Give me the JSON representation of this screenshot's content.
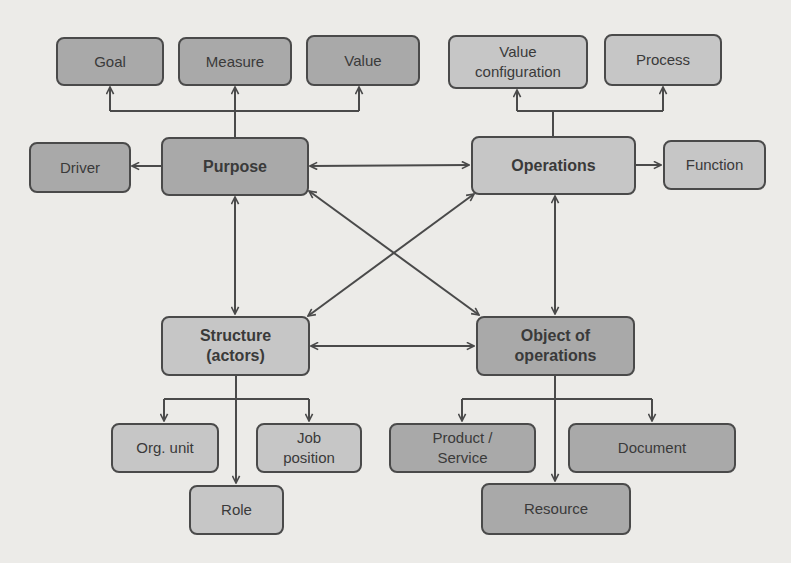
{
  "diagram": {
    "title": "",
    "colors": {
      "background": "#ecebe8",
      "node_dark": "#a9a9a9",
      "node_light": "#c6c6c6",
      "stroke": "#4a4a4a",
      "text": "#3a3a3a"
    },
    "nodes": {
      "goal": {
        "label": "Goal"
      },
      "measure": {
        "label": "Measure"
      },
      "value": {
        "label": "Value"
      },
      "value_configuration": {
        "label": "Value\nconfiguration"
      },
      "process": {
        "label": "Process"
      },
      "driver": {
        "label": "Driver"
      },
      "purpose": {
        "label": "Purpose"
      },
      "operations": {
        "label": "Operations"
      },
      "function": {
        "label": "Function"
      },
      "structure": {
        "label": "Structure\n(actors)"
      },
      "object_of_operations": {
        "label": "Object of\noperations"
      },
      "org_unit": {
        "label": "Org. unit"
      },
      "job_position": {
        "label": "Job\nposition"
      },
      "role": {
        "label": "Role"
      },
      "product_service": {
        "label": "Product /\nService"
      },
      "document": {
        "label": "Document"
      },
      "resource": {
        "label": "Resource"
      }
    },
    "edges": [
      {
        "from": "purpose",
        "to": "goal",
        "type": "directed"
      },
      {
        "from": "purpose",
        "to": "measure",
        "type": "directed"
      },
      {
        "from": "purpose",
        "to": "value",
        "type": "directed"
      },
      {
        "from": "purpose",
        "to": "driver",
        "type": "directed"
      },
      {
        "from": "operations",
        "to": "value_configuration",
        "type": "directed"
      },
      {
        "from": "operations",
        "to": "process",
        "type": "directed"
      },
      {
        "from": "operations",
        "to": "function",
        "type": "directed"
      },
      {
        "from": "purpose",
        "to": "operations",
        "type": "bidirectional"
      },
      {
        "from": "purpose",
        "to": "structure",
        "type": "bidirectional"
      },
      {
        "from": "purpose",
        "to": "object_of_operations",
        "type": "bidirectional"
      },
      {
        "from": "operations",
        "to": "structure",
        "type": "bidirectional"
      },
      {
        "from": "operations",
        "to": "object_of_operations",
        "type": "bidirectional"
      },
      {
        "from": "structure",
        "to": "object_of_operations",
        "type": "bidirectional"
      },
      {
        "from": "structure",
        "to": "org_unit",
        "type": "directed"
      },
      {
        "from": "structure",
        "to": "job_position",
        "type": "directed"
      },
      {
        "from": "structure",
        "to": "role",
        "type": "directed"
      },
      {
        "from": "object_of_operations",
        "to": "product_service",
        "type": "directed"
      },
      {
        "from": "object_of_operations",
        "to": "document",
        "type": "directed"
      },
      {
        "from": "object_of_operations",
        "to": "resource",
        "type": "directed"
      }
    ]
  }
}
